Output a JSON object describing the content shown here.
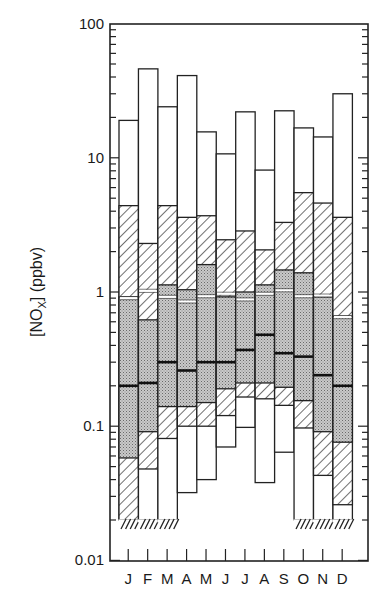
{
  "chart_data": {
    "type": "bar",
    "subtype": "floating-percentile-bars (log scale)",
    "title": "",
    "xlabel": "",
    "ylabel": "[NOx] (ppbv)",
    "ylabel_parts": {
      "open": "[NO",
      "sub": "X",
      "close": "] (ppbv)"
    },
    "yscale": "log",
    "ylim": [
      0.01,
      100
    ],
    "yticks": [
      0.01,
      0.1,
      1,
      10,
      100
    ],
    "ytick_labels": [
      "0.01",
      "0.1",
      "1",
      "10",
      "100"
    ],
    "grid": false,
    "legend": null,
    "categories": [
      "J",
      "F",
      "M",
      "A",
      "M",
      "J",
      "J",
      "A",
      "S",
      "O",
      "N",
      "D"
    ],
    "bands_description": "white = max/min range, hatched = outer percentile band, stippled = inner percentile band, bold line = median, thin white line = secondary marker",
    "series": [
      {
        "name": "max",
        "values": [
          19,
          46,
          24,
          41,
          15.6,
          10.7,
          22,
          8.1,
          22.4,
          16.7,
          14.3,
          30
        ]
      },
      {
        "name": "upper_hatched",
        "values": [
          4.4,
          2.3,
          4.4,
          3.6,
          3.7,
          2.45,
          2.85,
          2.06,
          3.3,
          5.5,
          4.6,
          3.6
        ]
      },
      {
        "name": "upper_stippled",
        "values": [
          0.92,
          0.62,
          1.13,
          1.04,
          1.6,
          0.92,
          1.0,
          1.13,
          1.46,
          1.39,
          0.92,
          0.66
        ]
      },
      {
        "name": "marker_line",
        "values": [
          0.9,
          1.02,
          0.92,
          0.85,
          0.93,
          0.97,
          0.88,
          0.97,
          1.03,
          0.93,
          0.94,
          0.65
        ]
      },
      {
        "name": "median",
        "values": [
          0.2,
          0.21,
          0.3,
          0.26,
          0.3,
          0.3,
          0.37,
          0.48,
          0.35,
          0.33,
          0.24,
          0.2
        ]
      },
      {
        "name": "lower_stippled",
        "values": [
          0.058,
          0.091,
          0.14,
          0.14,
          0.15,
          0.19,
          0.21,
          0.21,
          0.195,
          0.155,
          0.091,
          0.076
        ]
      },
      {
        "name": "lower_hatched",
        "values": [
          0.02,
          0.048,
          0.081,
          0.1,
          0.1,
          0.12,
          0.165,
          0.16,
          0.143,
          0.097,
          0.043,
          0.026
        ]
      },
      {
        "name": "min",
        "values": [
          0.02,
          0.02,
          0.02,
          0.032,
          0.04,
          0.07,
          0.098,
          0.038,
          0.064,
          0.02,
          0.02,
          0.02
        ]
      }
    ],
    "open_lower_end": [
      true,
      true,
      true,
      false,
      false,
      false,
      false,
      false,
      false,
      true,
      true,
      true
    ]
  }
}
